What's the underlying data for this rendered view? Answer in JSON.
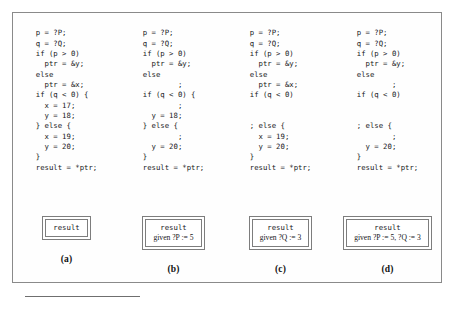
{
  "figure": {
    "columns": [
      {
        "id": "a",
        "caption": "(a)",
        "code": "p = ?P;\nq = ?Q;\nif (p > 0)\n  ptr = &y;\nelse\n  ptr = &x;\nif (q < 0) {\n  x = 17;\n  y = 18;\n} else {\n  x = 19;\n  y = 20;\n}\nresult = *ptr;",
        "result": {
          "title": "result",
          "given": ""
        }
      },
      {
        "id": "b",
        "caption": "(b)",
        "code": "p = ?P;\nq = ?Q;\nif (p > 0)\n  ptr = &y;\nelse\n        ;\nif (q < 0) {\n        ;\n  y = 18;\n} else {\n        ;\n  y = 20;\n}\nresult = *ptr;",
        "result": {
          "title": "result",
          "given": "given ?P := 5"
        }
      },
      {
        "id": "c",
        "caption": "(c)",
        "code": "p = ?P;\nq = ?Q;\nif (p > 0)\n  ptr = &y;\nelse\n  ptr = &x;\nif (q < 0)\n\n\n; else {\n  x = 19;\n  y = 20;\n}\nresult = *ptr;",
        "result": {
          "title": "result",
          "given": "given ?Q := 3"
        }
      },
      {
        "id": "d",
        "caption": "(d)",
        "code": "p = ?P;\nq = ?Q;\nif (p > 0)\n  ptr = &y;\nelse\n        ;\nif (q < 0)\n\n\n; else {\n        ;\n  y = 20;\n}\nresult = *ptr;",
        "result": {
          "title": "result",
          "given": "given ?P := 5, ?Q := 3"
        }
      }
    ]
  },
  "colors": {
    "frame_border": "#8a8a8a",
    "box_border": "#7d7d7d",
    "text": "#17171a",
    "page_background": "#ffffff"
  }
}
